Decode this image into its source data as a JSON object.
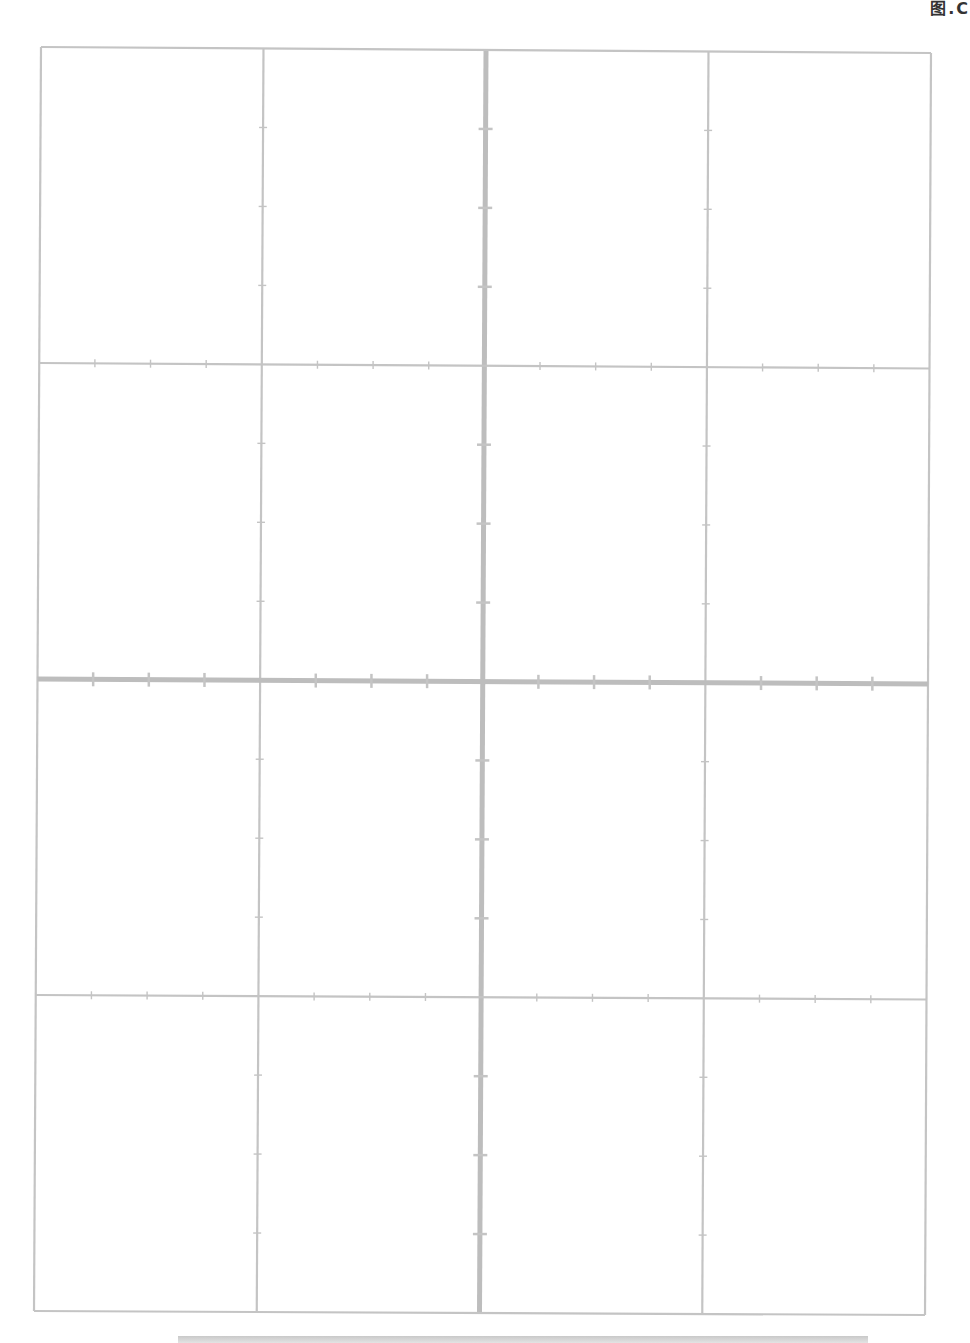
{
  "page": {
    "corner_label": "图.C",
    "grid": {
      "rows": 4,
      "cols": 4,
      "line_color": "#c4c4c4",
      "thick_line_color": "#bdbdbd",
      "corners": {
        "top_left": [
          41,
          47
        ],
        "top_right": [
          931,
          53
        ],
        "bottom_left": [
          34,
          1311
        ],
        "bottom_right": [
          925,
          1315
        ]
      },
      "thick_center_lines": true,
      "ticks_per_cell_edge": 3
    },
    "bottom_bar_color": "#cccccc"
  }
}
